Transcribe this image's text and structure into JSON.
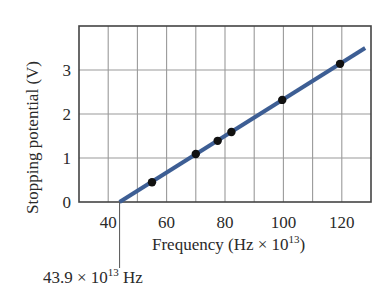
{
  "chart_data": {
    "type": "scatter",
    "title": "",
    "xlabel": "Frequency (Hz × 10¹³)",
    "xlabel_base": "Frequency (Hz × 10",
    "xlabel_exp": "13",
    "xlabel_close": ")",
    "ylabel": "Stopping potential (V)",
    "xlim": [
      30,
      130
    ],
    "ylim": [
      0,
      4
    ],
    "x_ticks": [
      40,
      60,
      80,
      100,
      120
    ],
    "x_tick_labels": [
      "40",
      "60",
      "80",
      "100",
      "120"
    ],
    "y_ticks": [
      0,
      1,
      2,
      3
    ],
    "y_tick_labels": [
      "0",
      "1",
      "2",
      "3"
    ],
    "x_grid_step": 10,
    "y_grid_step": 1,
    "grid": true,
    "legend": null,
    "series": [
      {
        "name": "measurements",
        "type": "scatter",
        "x": [
          55,
          70,
          77.5,
          82.2,
          99.6,
          119.4
        ],
        "y": [
          0.45,
          1.09,
          1.39,
          1.59,
          2.32,
          3.14
        ],
        "color": "#111111"
      },
      {
        "name": "fit line",
        "type": "line",
        "x": [
          43.9,
          128
        ],
        "y": [
          0,
          3.5
        ],
        "color": "#3d5e94"
      }
    ],
    "annotations": [
      {
        "text": "43.9 × 10¹³ Hz",
        "value_text": "43.9 × 10",
        "exp_text": "13",
        "unit_text": " Hz",
        "x": 43.9,
        "y": 0,
        "note": "x-intercept (threshold frequency)"
      }
    ]
  },
  "colors": {
    "line": "#3d5e94",
    "points": "#111111",
    "grid": "#9a9a9a",
    "frame": "#444444"
  }
}
